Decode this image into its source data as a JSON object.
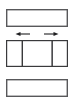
{
  "diagram": {
    "type": "schematic",
    "canvas": {
      "width": 74,
      "height": 105,
      "background": "#ffffff"
    },
    "panels": [
      {
        "id": "top-panel",
        "name": "top-plate",
        "label": "",
        "x": 6,
        "y": 9,
        "width": 62,
        "height": 18,
        "fill": "#ffffff",
        "stroke": "#58585a",
        "state": "empty"
      },
      {
        "id": "middle-panel",
        "name": "center-plate",
        "label": "",
        "x": 6,
        "y": 40,
        "width": 62,
        "height": 27,
        "fill": "#ffffff",
        "stroke": "#3a3a3c",
        "state": "segmented",
        "columns": [
          {
            "id": "left-cell",
            "label": "",
            "fill": "#ffffff",
            "state": "empty"
          },
          {
            "id": "center-cell",
            "label": "",
            "fill": "pinwheel",
            "state": "patterned"
          },
          {
            "id": "right-cell",
            "label": "",
            "fill": "#ffffff",
            "state": "empty"
          }
        ],
        "divider_x": [
          22,
          52
        ]
      },
      {
        "id": "bottom-panel",
        "name": "bottom-plate",
        "label": "",
        "x": 6,
        "y": 79,
        "width": 62,
        "height": 18,
        "fill": "#ffffff",
        "stroke": "#58585a",
        "state": "empty"
      }
    ],
    "pinwheel": {
      "name": "x-pattern",
      "cell": {
        "x": 22,
        "y": 40,
        "width": 30,
        "height": 27
      },
      "center": {
        "x": 37,
        "y": 53.5
      },
      "wedge_count": 8,
      "wedges": [
        {
          "position": "top-left-upper",
          "shade": "#ffffff"
        },
        {
          "position": "top-left-lower",
          "shade": "#979797"
        },
        {
          "position": "top-right-upper",
          "shade": "#ffffff"
        },
        {
          "position": "top-right-lower",
          "shade": "#c8c8c8"
        },
        {
          "position": "bottom-right-lower",
          "shade": "#ffffff"
        },
        {
          "position": "bottom-right-upper",
          "shade": "#979797"
        },
        {
          "position": "bottom-left-lower",
          "shade": "#ffffff"
        },
        {
          "position": "bottom-left-upper",
          "shade": "#c8c8c8"
        }
      ],
      "shade_light": "#ffffff",
      "shade_mid": "#c8c8c8",
      "shade_dark": "#979797",
      "outline": "#3a3a3c"
    },
    "arrows": [
      {
        "id": "left-arrow",
        "name": "expand-left-arrow",
        "direction": "left",
        "label": "",
        "x1": 30,
        "x2": 16,
        "y": 34,
        "color": "#1f1f21"
      },
      {
        "id": "right-arrow",
        "name": "expand-right-arrow",
        "direction": "right",
        "label": "",
        "x1": 44,
        "x2": 58,
        "y": 34,
        "color": "#1f1f21"
      }
    ]
  }
}
